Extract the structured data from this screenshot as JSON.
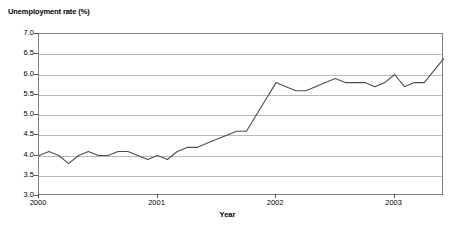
{
  "chart_data": {
    "type": "line",
    "title": "Unemployment rate (%)",
    "xlabel": "Year",
    "ylabel": "Unemployment rate (%)",
    "ylim": [
      3.0,
      7.0
    ],
    "ytick_labels": [
      "7.0",
      "6.5",
      "6.0",
      "5.5",
      "5.0",
      "4.5",
      "4.0",
      "3.5",
      "3.0"
    ],
    "ytick_values": [
      7.0,
      6.5,
      6.0,
      5.5,
      5.0,
      4.5,
      4.0,
      3.5,
      3.0
    ],
    "xtick_labels": [
      "2000",
      "2001",
      "2002",
      "2003"
    ],
    "xtick_values": [
      0,
      12,
      24,
      36
    ],
    "xlim": [
      0,
      41
    ],
    "grid": "horizontal",
    "legend": "none",
    "line_color": "#4d4d4d",
    "series": [
      {
        "name": "Unemployment rate",
        "values": [
          4.0,
          4.1,
          4.0,
          3.8,
          4.0,
          4.1,
          4.0,
          4.0,
          4.1,
          4.1,
          4.0,
          3.9,
          4.0,
          3.9,
          4.1,
          4.2,
          4.2,
          4.3,
          4.4,
          4.5,
          4.6,
          4.6,
          5.0,
          5.4,
          5.8,
          5.7,
          5.6,
          5.6,
          5.7,
          5.8,
          5.9,
          5.8,
          5.8,
          5.8,
          5.7,
          5.8,
          6.0,
          5.7,
          5.8,
          5.8,
          6.1,
          6.4
        ]
      }
    ]
  }
}
